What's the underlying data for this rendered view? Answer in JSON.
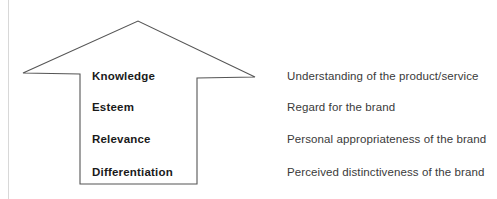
{
  "diagram": {
    "type": "upward-arrow-pillars",
    "shape_name": "upward-arrow",
    "outline_color": "#555555",
    "fill_color": "#ffffff",
    "background_color": "#ffffff",
    "label_color": "#1a1a1a",
    "description_color": "#3a3a3a",
    "geometry": {
      "apex_x": 138,
      "apex_y": 21,
      "left_tip_x": 23,
      "left_tip_y": 73,
      "right_tip_x": 255,
      "right_tip_y": 77,
      "shaft_left_x": 80,
      "shaft_right_x": 197,
      "shaft_bottom_y": 184
    },
    "rows": [
      {
        "label": "Knowledge",
        "description": "Understanding of the product/service"
      },
      {
        "label": "Esteem",
        "description": "Regard for the brand"
      },
      {
        "label": "Relevance",
        "description": "Personal appropriateness of the brand"
      },
      {
        "label": "Differentiation",
        "description": "Perceived distinctiveness of the brand"
      }
    ]
  }
}
